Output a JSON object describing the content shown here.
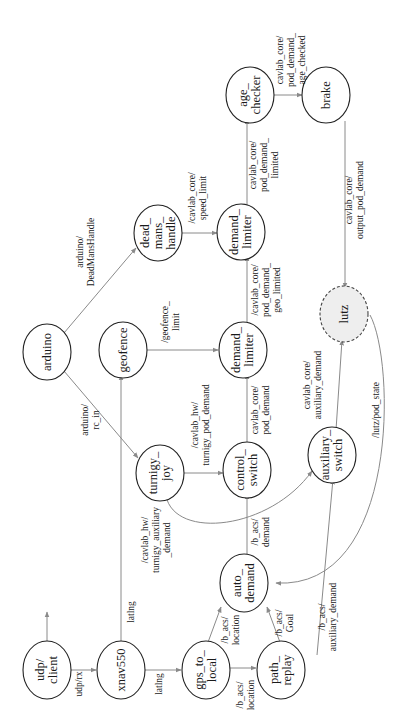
{
  "diagram": {
    "title": "",
    "orientation": "rotated-90-ccw",
    "colors": {
      "node_stroke": "#222222",
      "edge": "#8a8a8a",
      "external_node_fill": "#eeeeee"
    },
    "nodes": {
      "udp_client": {
        "lines": [
          "udp/",
          "client"
        ]
      },
      "xnav550": {
        "lines": [
          "xnav550"
        ]
      },
      "gps_to_local": {
        "lines": [
          "gps_to_",
          "local"
        ]
      },
      "path_replay": {
        "lines": [
          "path_",
          "replay"
        ]
      },
      "auto_demand": {
        "lines": [
          "auto_",
          "demand"
        ]
      },
      "arduino": {
        "lines": [
          "arduino"
        ]
      },
      "geofence": {
        "lines": [
          "geofence"
        ]
      },
      "turnigy_joy": {
        "lines": [
          "turnigy_",
          "joy"
        ]
      },
      "control_switch": {
        "lines": [
          "control_",
          "switch"
        ]
      },
      "demand_limiter_geo": {
        "lines": [
          "demand_",
          "limiter"
        ]
      },
      "dead_mans_handle": {
        "lines": [
          "dead_",
          "mans_",
          "handle"
        ]
      },
      "demand_limiter_speed": {
        "lines": [
          "demand_",
          "limiter"
        ]
      },
      "age_checker": {
        "lines": [
          "age_",
          "checker"
        ]
      },
      "brake": {
        "lines": [
          "brake"
        ]
      },
      "auxiliary_switch": {
        "lines": [
          "auxiliary_",
          "switch"
        ]
      },
      "lutz": {
        "lines": [
          "lutz"
        ],
        "external": true
      }
    },
    "edges": {
      "udp_rx": {
        "from": "udp_client",
        "to": "xnav550",
        "lines": [
          "udp/rx"
        ]
      },
      "latlng_gps": {
        "from": "xnav550",
        "to": "gps_to_local",
        "lines": [
          "latlng"
        ]
      },
      "latlng_geofence": {
        "from": "xnav550",
        "to": "geofence",
        "lines": [
          "latlng"
        ]
      },
      "location_path": {
        "from": "gps_to_local",
        "to": "path_replay",
        "lines": [
          "/b_acs/",
          "location"
        ]
      },
      "location_auto": {
        "from": "gps_to_local",
        "to": "auto_demand",
        "lines": [
          "/b_acs/",
          "location"
        ]
      },
      "goal": {
        "from": "path_replay",
        "to": "auto_demand",
        "lines": [
          "/b_acs/",
          "Goal"
        ]
      },
      "aux_demand": {
        "from": "path_replay",
        "to": "auxiliary_switch",
        "lines": [
          "/b_acs/",
          "auxiliary_demand"
        ]
      },
      "demand": {
        "from": "auto_demand",
        "to": "control_switch",
        "lines": [
          "/b_acs/",
          "demand"
        ]
      },
      "rc_in": {
        "from": "arduino",
        "to": "turnigy_joy",
        "lines": [
          "arduino/",
          "rc_in"
        ]
      },
      "deadmans": {
        "from": "arduino",
        "to": "dead_mans_handle",
        "lines": [
          "arduino/",
          "DeadMansHandle"
        ]
      },
      "turnigy_pod": {
        "from": "turnigy_joy",
        "to": "control_switch",
        "lines": [
          "/cavlab_hw/",
          "turnigy_pod_demand"
        ]
      },
      "turnigy_aux": {
        "from": "turnigy_joy",
        "to": "auxiliary_switch",
        "lines": [
          "/cavlab_hw/",
          "turnigy_auxiliary",
          "_demand"
        ]
      },
      "pod_demand": {
        "from": "control_switch",
        "to": "demand_limiter_geo",
        "lines": [
          "cavlab_core/",
          "pod_demand"
        ]
      },
      "geofence_limit": {
        "from": "geofence",
        "to": "demand_limiter_geo",
        "lines": [
          "/geofence_",
          "limit"
        ]
      },
      "geo_limited": {
        "from": "demand_limiter_geo",
        "to": "demand_limiter_speed",
        "lines": [
          "/cavlab_core/",
          "pod_demand_",
          "geo_limited"
        ]
      },
      "speed_limit": {
        "from": "dead_mans_handle",
        "to": "demand_limiter_speed",
        "lines": [
          "/cavlab_core/",
          "speed_limit"
        ]
      },
      "limited": {
        "from": "demand_limiter_speed",
        "to": "age_checker",
        "lines": [
          "cavlab_core/",
          "pod_demand_",
          "limited"
        ]
      },
      "age_checked": {
        "from": "age_checker",
        "to": "brake",
        "lines": [
          "cavlab_core/",
          "pod_demand_",
          "age_checked"
        ]
      },
      "output": {
        "from": "brake",
        "to": "lutz",
        "lines": [
          "cavlab_core/",
          "output_pod_demand"
        ]
      },
      "aux_core": {
        "from": "auxiliary_switch",
        "to": "lutz",
        "lines": [
          "cavlab_core/",
          "auxiliary_demand"
        ]
      },
      "pod_state": {
        "from": "lutz",
        "to": "auto_demand",
        "lines": [
          "/lutz/pod_state"
        ]
      }
    }
  }
}
